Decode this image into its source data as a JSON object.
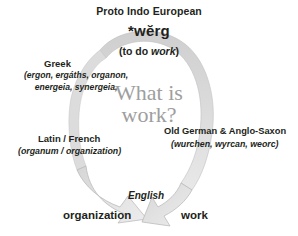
{
  "diagram": {
    "center_question_line1": "What is",
    "center_question_line2": "work?",
    "arrow_color": "#c9c9c9",
    "arrow_stroke": "#a8a8a8",
    "text_color": "#231f20",
    "question_color": "#9e9e9e"
  },
  "root": {
    "title": "Proto Indo European",
    "term": "*wĕrg",
    "gloss_prefix": "(to do ",
    "gloss_italic": "work",
    "gloss_suffix": ")"
  },
  "branches": [
    {
      "id": "greek",
      "title": "Greek",
      "terms": "(ergon, ergáths, organon, energeia, synergeia,"
    },
    {
      "id": "latin-french",
      "title": "Latin / French",
      "terms": "(organum / organization)"
    },
    {
      "id": "old-german-anglo-saxon",
      "title": "Old German & Anglo-Saxon",
      "terms": "(wurchen, wyrcan, weorc)"
    }
  ],
  "outcome": {
    "language": "English",
    "left_word": "organization",
    "right_word": "work"
  }
}
